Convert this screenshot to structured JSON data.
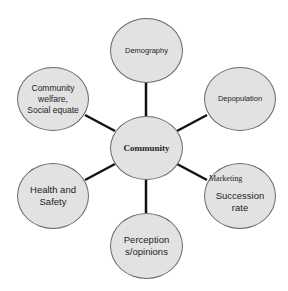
{
  "diagram": {
    "type": "hub-and-spoke",
    "center": {
      "label": "Community"
    },
    "nodes": [
      {
        "id": "demography",
        "label": "Demography"
      },
      {
        "id": "depopulation",
        "label": "Depopulation"
      },
      {
        "id": "marketing-succession",
        "label_top": "Marketing",
        "label_main": "Succession rate"
      },
      {
        "id": "perceptions",
        "label": "Perception s/opinions"
      },
      {
        "id": "health-safety",
        "label": "Health and Safety"
      },
      {
        "id": "community-welfare",
        "label": "Community welfare, Social equate"
      }
    ],
    "colors": {
      "node_fill": "#e2e2e2",
      "node_border": "#6a6a6a",
      "connector": "#111111"
    }
  }
}
